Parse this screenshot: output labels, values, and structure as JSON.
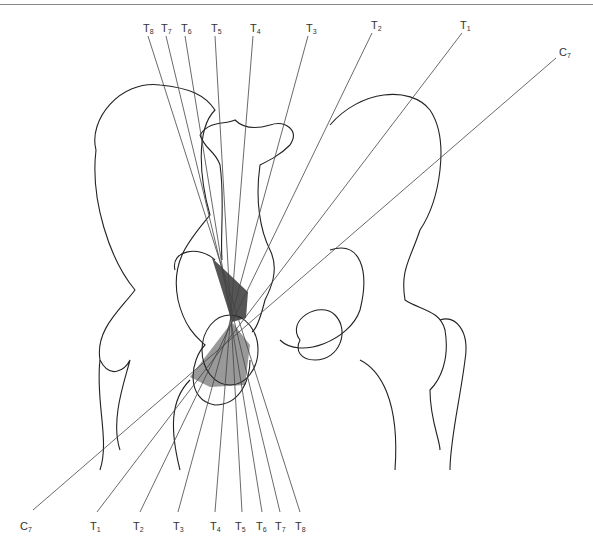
{
  "figure": {
    "title": "",
    "top_labels": [
      {
        "base": "T",
        "sub": "8",
        "x": 143,
        "y": 22
      },
      {
        "base": "T",
        "sub": "7",
        "x": 161,
        "y": 22
      },
      {
        "base": "T",
        "sub": "6",
        "x": 181,
        "y": 22
      },
      {
        "base": "T",
        "sub": "5",
        "x": 211,
        "y": 22
      },
      {
        "base": "T",
        "sub": "4",
        "x": 250,
        "y": 22
      },
      {
        "base": "T",
        "sub": "3",
        "x": 306,
        "y": 22
      },
      {
        "base": "T",
        "sub": "2",
        "x": 371,
        "y": 19
      },
      {
        "base": "T",
        "sub": "1",
        "x": 460,
        "y": 19
      },
      {
        "base": "C",
        "sub": "7",
        "x": 559,
        "y": 46
      }
    ],
    "bottom_labels": [
      {
        "base": "C",
        "sub": "7",
        "x": 20,
        "y": 520
      },
      {
        "base": "T",
        "sub": "1",
        "x": 90,
        "y": 520
      },
      {
        "base": "T",
        "sub": "2",
        "x": 133,
        "y": 520
      },
      {
        "base": "T",
        "sub": "3",
        "x": 173,
        "y": 520
      },
      {
        "base": "T",
        "sub": "4",
        "x": 210,
        "y": 520
      },
      {
        "base": "T",
        "sub": "5",
        "x": 235,
        "y": 520
      },
      {
        "base": "T",
        "sub": "6",
        "x": 256,
        "y": 520
      },
      {
        "base": "T",
        "sub": "7",
        "x": 275,
        "y": 520
      },
      {
        "base": "T",
        "sub": "8",
        "x": 295,
        "y": 520
      }
    ]
  }
}
